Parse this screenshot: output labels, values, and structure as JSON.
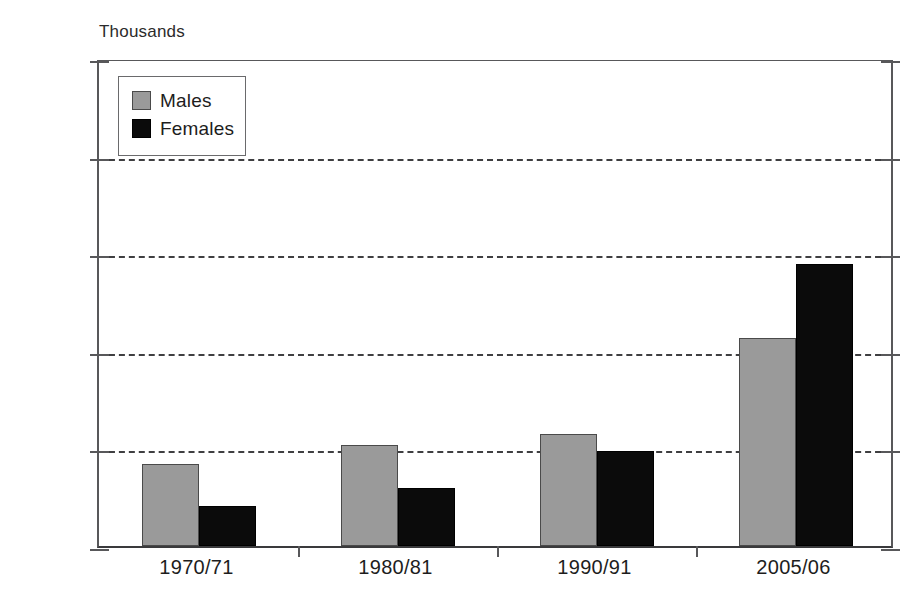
{
  "chart_data": {
    "type": "bar",
    "title": "",
    "subtitle": "",
    "unit_caption": "Thousands",
    "xlabel": "",
    "ylabel": "Thousands",
    "ylim": [
      0,
      2500
    ],
    "ytick_step": 500,
    "grid": "horizontal-dashed",
    "legend_position": "top-left",
    "categories": [
      "1970/71",
      "1980/81",
      "1990/91",
      "2005/06"
    ],
    "ytick_labels": [
      "0",
      "500",
      "1,000",
      "1,500",
      "2,000",
      "2,500"
    ],
    "ytick_values": [
      0,
      500,
      1000,
      1500,
      2000,
      2500
    ],
    "series": [
      {
        "name": "Males",
        "color": "#9a9a9a",
        "values": [
          420,
          520,
          575,
          1065
        ]
      },
      {
        "name": "Females",
        "color": "#0b0b0b",
        "values": [
          205,
          295,
          485,
          1445
        ]
      }
    ]
  },
  "legend": {
    "items": [
      {
        "label": "Males"
      },
      {
        "label": "Females"
      }
    ]
  },
  "colors": {
    "males": "#9a9a9a",
    "females": "#0b0b0b",
    "axis": "#58585a",
    "grid": "#3f3f41",
    "background": "#ffffff"
  }
}
